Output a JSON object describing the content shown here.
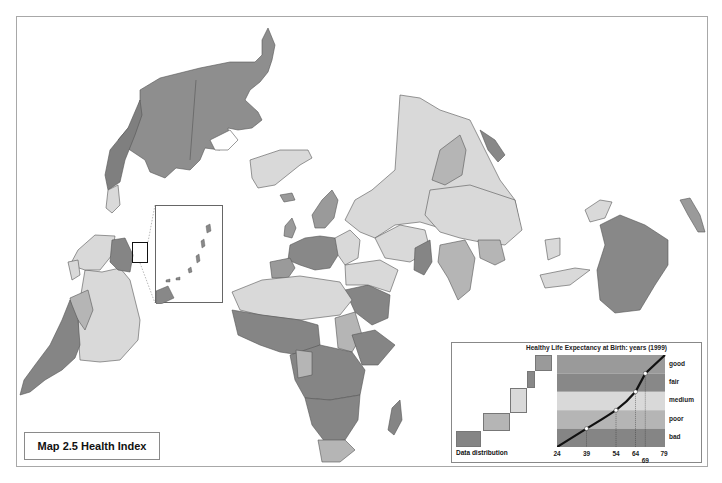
{
  "map": {
    "title": "Map 2.5 Health Index",
    "projection": "rotated world map (Americas inverted on left, Eurasia and Africa center, Oceania right)",
    "colors": {
      "good": "#9a9a9a",
      "fair": "#888888",
      "medium": "#d9d9d9",
      "poor": "#b5b5b5",
      "bad": "#858585",
      "border": "#555555",
      "ocean": "#ffffff"
    }
  },
  "legend": {
    "title": "Healthy Life Expectancy at Birth: years (1999)",
    "distribution_label": "Data distribution",
    "bands": [
      {
        "label": "good",
        "color": "#9a9a9a"
      },
      {
        "label": "fair",
        "color": "#888888"
      },
      {
        "label": "medium",
        "color": "#d9d9d9"
      },
      {
        "label": "poor",
        "color": "#b5b5b5"
      },
      {
        "label": "bad",
        "color": "#858585"
      }
    ],
    "ticks": [
      "24",
      "39",
      "54",
      "64",
      "69",
      "79"
    ],
    "thresholds": [
      {
        "band_boundary": "bad/poor",
        "value": 39
      },
      {
        "band_boundary": "poor/medium",
        "value": 54
      },
      {
        "band_boundary": "medium/fair",
        "value": 64
      },
      {
        "band_boundary": "fair/good",
        "value": 69
      }
    ],
    "range": [
      24,
      79
    ]
  }
}
